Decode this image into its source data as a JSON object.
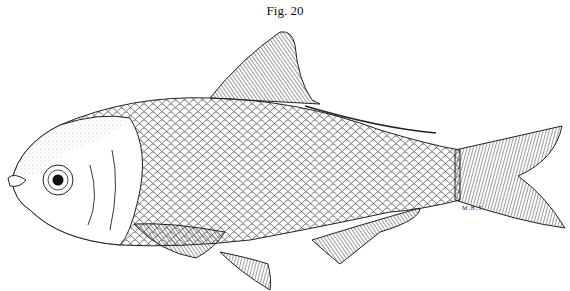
{
  "figure": {
    "caption": "Fig. 20",
    "artist_initials": "M.B.T."
  },
  "colors": {
    "ink": "#1a1a1a",
    "background": "#ffffff"
  }
}
